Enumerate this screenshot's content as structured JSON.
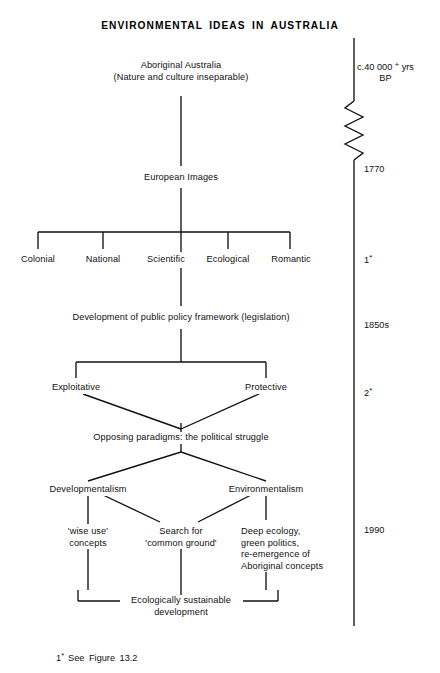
{
  "figure": {
    "title": "ENVIRONMENTAL IDEAS IN AUSTRALIA",
    "footnote": "See  Figure  13.2",
    "footnote_marker": "1",
    "footnote_star": "*"
  },
  "flow": {
    "root": {
      "line1": "Aboriginal Australia",
      "line2": "(Nature and culture inseparable)"
    },
    "european_images": "European Images",
    "streams": [
      {
        "label": "Colonial"
      },
      {
        "label": "National"
      },
      {
        "label": "Scientific"
      },
      {
        "label": "Ecological"
      },
      {
        "label": "Romantic"
      }
    ],
    "policy": "Development of public policy framework (legislation)",
    "policy_branches": [
      {
        "label": "Exploitative"
      },
      {
        "label": "Protective"
      }
    ],
    "paradigms": "Opposing paradigms: the political struggle",
    "paradigm_branches": [
      {
        "label": "Developmentalism"
      },
      {
        "label": "Environmentalism"
      }
    ],
    "outcomes": [
      {
        "line1": "'wise use'",
        "line2": "concepts",
        "line3": "",
        "line4": ""
      },
      {
        "line1": "Search for",
        "line2": "'common ground'",
        "line3": "",
        "line4": ""
      },
      {
        "line1": "Deep ecology,",
        "line2": "green politics,",
        "line3": "re-emergence of",
        "line4": "Aboriginal concepts"
      }
    ],
    "synthesis": {
      "line1": "Ecologically sustainable",
      "line2": "development"
    }
  },
  "timeline": {
    "marks": [
      {
        "id": "bp",
        "line1_pre": "c.40 000 ",
        "line1_sup": "+",
        "line1_post": " yrs",
        "line2": "BP"
      },
      {
        "id": "y1770",
        "label": "1770"
      },
      {
        "id": "note1",
        "label": "1",
        "star": "*"
      },
      {
        "id": "y1850s",
        "label": "1850s"
      },
      {
        "id": "note2",
        "label": "2",
        "star": "*"
      },
      {
        "id": "y1990",
        "label": "1990"
      }
    ]
  },
  "colors": {
    "ink": "#111111",
    "paper": "#ffffff"
  }
}
